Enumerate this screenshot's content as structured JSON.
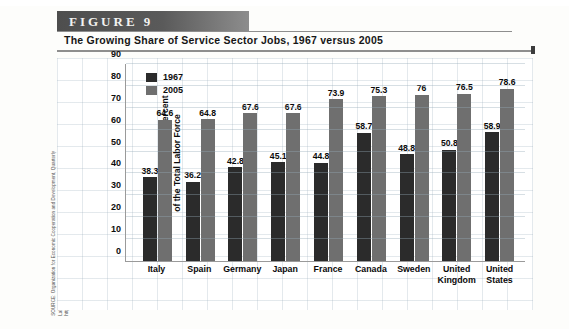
{
  "figure": {
    "band_label": "FIGURE  9",
    "title": "The Growing Share of Service Sector Jobs, 1967 versus 2005",
    "source_note": "SOURCE: Organization for Economic Cooperation and Development, Quarterly\nLabour Force Statistics, various issues, and Labour Force Statistics, 1984–2005,\nhttp://www.sourceoecd.org."
  },
  "colors": {
    "series_1967": "#2b2b2b",
    "series_2005": "#6f6f6f",
    "band": "#4e4e4e",
    "grid": "#9ab0bd",
    "axis": "#9a9a9a"
  },
  "chart_data": {
    "type": "bar",
    "title": "The Growing Share of Service Sector Jobs, 1967 versus 2005",
    "xlabel": "",
    "ylabel": "Service Sector Jobs as a Percent\nof the Total Labor Force",
    "ylim": [
      0,
      90
    ],
    "yticks": [
      90,
      80,
      70,
      60,
      50,
      40,
      30,
      20,
      10,
      0
    ],
    "grid": true,
    "legend_position": "top-left",
    "categories": [
      "Italy",
      "Spain",
      "Germany",
      "Japan",
      "France",
      "Canada",
      "Sweden",
      "United\nKingdom",
      "United\nStates"
    ],
    "series": [
      {
        "name": "1967",
        "color": "#2b2b2b",
        "values": [
          38.3,
          36.2,
          42.8,
          45.1,
          44.8,
          58.7,
          48.8,
          50.8,
          58.9
        ]
      },
      {
        "name": "2005",
        "color": "#6f6f6f",
        "values": [
          64.6,
          64.8,
          67.6,
          67.6,
          73.9,
          75.3,
          76,
          76.5,
          78.6
        ]
      }
    ]
  }
}
